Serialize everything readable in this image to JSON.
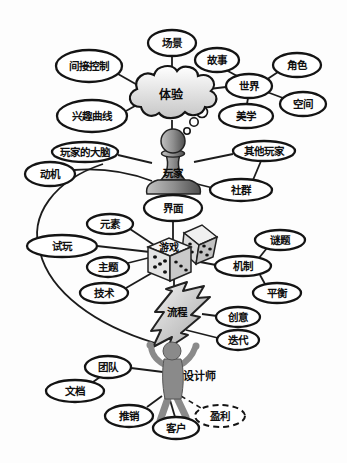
{
  "figure": {
    "background": "#fdfdfd",
    "ink": "#1c1c1c",
    "node_fill": "#ffffff",
    "figure_gray": "#8a8a8a"
  },
  "hubs": {
    "experience": "体验",
    "player": "玩家",
    "game": "游戏",
    "process": "流程",
    "designer": "设计师"
  },
  "nodes": {
    "scene": "场景",
    "story": "故事",
    "character": "角色",
    "indirect_control": "间接控制",
    "world": "世界",
    "space": "空间",
    "interest_curve": "兴趣曲线",
    "aesthetics": "美学",
    "players_brain": "玩家的大脑",
    "other_players": "其他玩家",
    "motivation": "动机",
    "community": "社群",
    "interface": "界面",
    "elements": "元素",
    "playtest": "试玩",
    "puzzle": "谜题",
    "theme": "主题",
    "mechanics": "机制",
    "technology": "技术",
    "balance": "平衡",
    "idea": "创意",
    "iteration": "迭代",
    "team": "团队",
    "document": "文档",
    "pitch": "推销",
    "client": "客户",
    "profit": "盈利"
  }
}
